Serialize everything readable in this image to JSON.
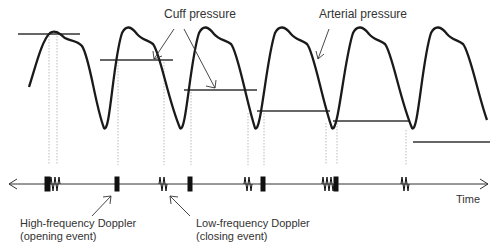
{
  "labels": {
    "cuff_pressure": "Cuff pressure",
    "arterial_pressure": "Arterial pressure",
    "time": "Time",
    "high_freq_line1": "High-frequency Doppler",
    "high_freq_line2": "(opening event)",
    "low_freq_line1": "Low-frequency Doppler",
    "low_freq_line2": "(closing event)"
  },
  "waveform": {
    "cycles": 6,
    "color": "#222222"
  },
  "cuff_levels": [
    {
      "x1": 18,
      "x2": 80,
      "y": 34
    },
    {
      "x1": 100,
      "x2": 173,
      "y": 60
    },
    {
      "x1": 184,
      "x2": 257,
      "y": 90
    },
    {
      "x1": 257,
      "x2": 330,
      "y": 111
    },
    {
      "x1": 333,
      "x2": 410,
      "y": 121
    },
    {
      "x1": 413,
      "x2": 490,
      "y": 142
    }
  ],
  "doppler_events": [
    {
      "x": 47,
      "type": "high-frequency"
    },
    {
      "x": 53,
      "type": "low-frequency"
    },
    {
      "x": 117,
      "type": "high-frequency"
    },
    {
      "x": 163,
      "type": "low-frequency"
    },
    {
      "x": 190,
      "type": "high-frequency"
    },
    {
      "x": 248,
      "type": "low-frequency"
    },
    {
      "x": 263,
      "type": "high-frequency"
    },
    {
      "x": 327,
      "type": "low-frequency"
    },
    {
      "x": 337,
      "type": "high-frequency"
    },
    {
      "x": 405,
      "type": "low-frequency"
    }
  ]
}
